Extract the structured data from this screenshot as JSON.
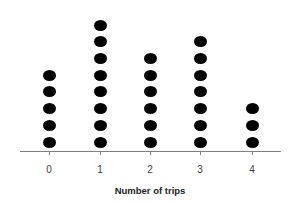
{
  "chart_data": {
    "type": "dot",
    "title": "",
    "xlabel": "Number of trips",
    "ylabel": "",
    "categories": [
      "0",
      "1",
      "2",
      "3",
      "4"
    ],
    "values": [
      5,
      8,
      6,
      7,
      3
    ],
    "grid": false,
    "legend": null,
    "marker_color": "#000000",
    "axis_color": "#7f7f7f"
  }
}
